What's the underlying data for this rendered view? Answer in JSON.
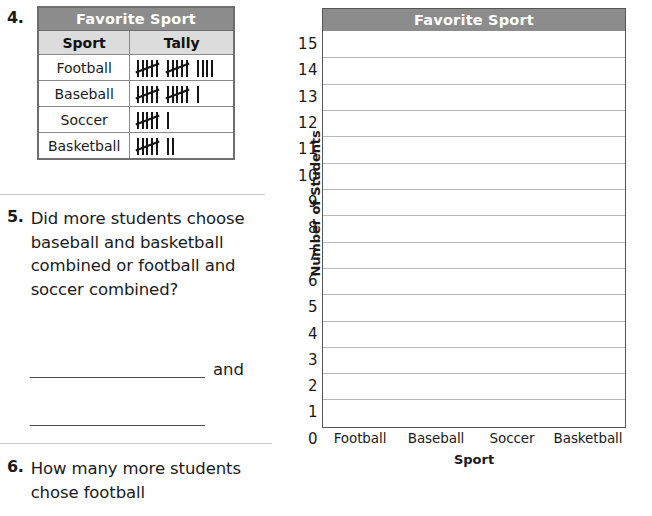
{
  "worksheet": {
    "items": [
      {
        "number": "4."
      },
      {
        "number": "5.",
        "text": "Did more students choose baseball and basketball combined or football and soccer combined?",
        "conjunction": "and"
      },
      {
        "number": "6.",
        "text": "How many more students chose football"
      }
    ]
  },
  "tally_table": {
    "title": "Favorite Sport",
    "headers": [
      "Sport",
      "Tally"
    ],
    "rows": [
      {
        "sport": "Football",
        "tally_count": 14,
        "tally_text": "14"
      },
      {
        "sport": "Baseball",
        "tally_count": 11,
        "tally_text": "11"
      },
      {
        "sport": "Soccer",
        "tally_count": 6,
        "tally_text": "6"
      },
      {
        "sport": "Basketball",
        "tally_count": 7,
        "tally_text": "7"
      }
    ]
  },
  "chart_data": {
    "type": "bar",
    "title": "Favorite Sport",
    "xlabel": "Sport",
    "ylabel": "Number of Students",
    "categories": [
      "Football",
      "Baseball",
      "Soccer",
      "Basketball"
    ],
    "values": [
      0,
      0,
      0,
      0
    ],
    "ylim": [
      0,
      15
    ],
    "ytick_labels": [
      "15",
      "14",
      "13",
      "12",
      "11",
      "10",
      "9",
      "8",
      "7",
      "6",
      "5",
      "4",
      "3",
      "2",
      "1",
      "0"
    ],
    "grid": true,
    "legend": "none",
    "note": "Blank grid for student to draw bars; tally data gives Football 14, Baseball 11, Soccer 6, Basketball 7"
  },
  "colors": {
    "title_bar": "#8c8c8c",
    "subheader": "#dcdcdc",
    "gridline": "#b9b9b9",
    "frame": "#555555",
    "divider": "#c8c8c8",
    "text": "#1a1a1a"
  }
}
